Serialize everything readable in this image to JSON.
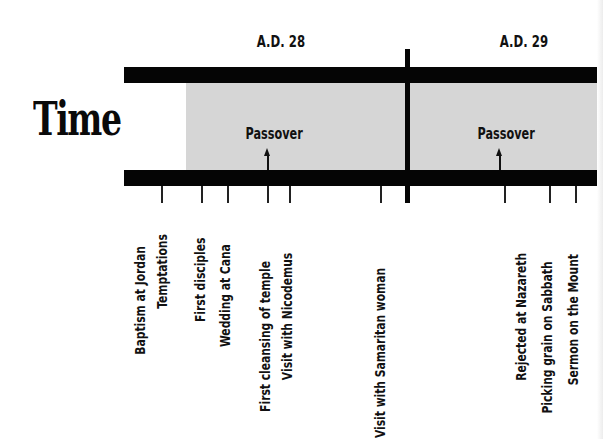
{
  "diagram": {
    "title": "Time",
    "years": [
      {
        "label": "A.D. 28",
        "center_x": 280
      },
      {
        "label": "A.D. 29",
        "center_x": 523
      }
    ],
    "timeline": {
      "bar_color": "#050505",
      "band_color": "#d6d6d6",
      "year_divider_x": 407
    },
    "passovers": [
      {
        "label": "Passover",
        "x": 268
      },
      {
        "label": "Passover",
        "x": 500
      }
    ],
    "events": [
      {
        "label": "Baptism at Jordan",
        "x": 162
      },
      {
        "label": "Temptations",
        "x": 162
      },
      {
        "label": "First disciples",
        "x": 202
      },
      {
        "label": "Wedding at Cana",
        "x": 228
      },
      {
        "label": "First cleansing of temple",
        "x": 268
      },
      {
        "label": "Visit with Nicodemus",
        "x": 290
      },
      {
        "label": "Visit with Samaritan woman",
        "x": 381
      },
      {
        "label": "Rejected at Nazareth",
        "x": 505
      },
      {
        "label": "Picking grain on Sabbath",
        "x": 550
      },
      {
        "label": "Sermon on the Mount",
        "x": 576
      }
    ]
  }
}
